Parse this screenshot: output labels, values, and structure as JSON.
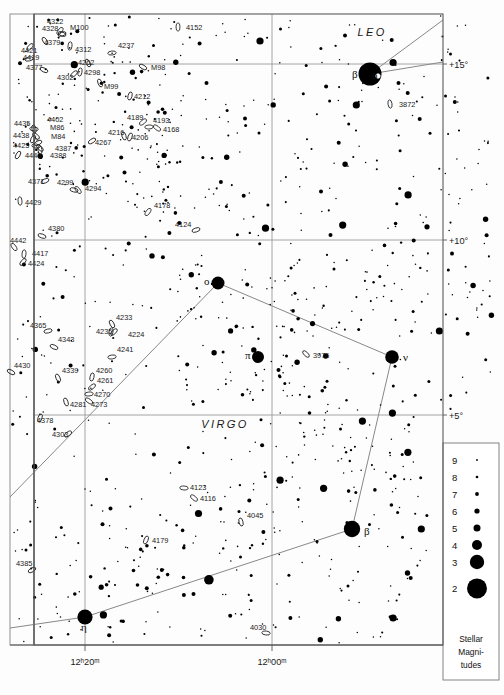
{
  "chart_data": {
    "type": "scatter",
    "xlabel": "Right Ascension",
    "ylabel": "Declination",
    "grid": true,
    "x_ticks": [
      {
        "label": "12ʰ20ᵐ",
        "x": 85
      },
      {
        "label": "12ʰ00ᵐ",
        "x": 272
      }
    ],
    "y_ticks": [
      {
        "label": "+15°",
        "y": 64
      },
      {
        "label": "+10°",
        "y": 240
      },
      {
        "label": "+5°",
        "y": 415
      }
    ],
    "constellations": [
      {
        "name": "LEO",
        "x": 372,
        "y": 36
      },
      {
        "name": "VIRGO",
        "x": 225,
        "y": 428
      }
    ],
    "named_stars": [
      {
        "name": "β",
        "x": 370,
        "y": 74,
        "r": 11.5,
        "label_dx": -18,
        "label_dy": 4
      },
      {
        "name": "o",
        "x": 378,
        "y": 76,
        "r": 2.2,
        "label_dx": -6,
        "label_dy": 3,
        "open": true
      },
      {
        "name": "ο",
        "x": 218,
        "y": 283,
        "r": 6.5,
        "label_dx": -14,
        "label_dy": 2
      },
      {
        "name": "π",
        "x": 258,
        "y": 357,
        "r": 6.0,
        "label_dx": -13,
        "label_dy": 2
      },
      {
        "name": "ν",
        "x": 392,
        "y": 357,
        "r": 6.8,
        "label_dx": 11,
        "label_dy": 4
      },
      {
        "name": "β",
        "x": 352,
        "y": 529,
        "r": 8.2,
        "label_dx": 12,
        "label_dy": 6
      },
      {
        "name": "η",
        "x": 85,
        "y": 617,
        "r": 7.6,
        "label_dx": -4,
        "label_dy": 14
      }
    ],
    "constellation_lines": [
      [
        [
          218,
          283
        ],
        [
          392,
          357
        ]
      ],
      [
        [
          218,
          283
        ],
        [
          10,
          497
        ]
      ],
      [
        [
          392,
          357
        ],
        [
          352,
          529
        ]
      ],
      [
        [
          352,
          529
        ],
        [
          85,
          617
        ]
      ],
      [
        [
          85,
          617
        ],
        [
          10,
          628
        ]
      ],
      [
        [
          370,
          74
        ],
        [
          443,
          20
        ]
      ],
      [
        [
          370,
          74
        ],
        [
          443,
          62
        ]
      ]
    ],
    "galaxies": [
      {
        "id": "4152",
        "lx": 186,
        "ly": 30,
        "ex": 178,
        "ey": 27
      },
      {
        "id": "4322",
        "lx": 47,
        "ly": 24,
        "ex": 60,
        "ey": 31
      },
      {
        "id": "4328",
        "lx": 42,
        "ly": 31,
        "ex": 62,
        "ey": 34
      },
      {
        "id": "M100",
        "lx": 70,
        "ly": 30,
        "ex": 62,
        "ey": 34
      },
      {
        "id": "4379",
        "lx": 44,
        "ly": 45,
        "ex": 45,
        "ey": 41
      },
      {
        "id": "4312",
        "lx": 75,
        "ly": 52,
        "ex": 70,
        "ey": 46
      },
      {
        "id": "4421",
        "lx": 21,
        "ly": 53,
        "ex": 30,
        "ey": 47
      },
      {
        "id": "4419",
        "lx": 23,
        "ly": 60,
        "ex": 29,
        "ey": 59
      },
      {
        "id": "4377",
        "lx": 26,
        "ly": 70,
        "ex": 44,
        "ey": 70
      },
      {
        "id": "4262",
        "lx": 78,
        "ly": 65,
        "ex": 88,
        "ey": 63
      },
      {
        "id": "4298",
        "lx": 84,
        "ly": 75,
        "ex": 80,
        "ey": 72
      },
      {
        "id": "4302",
        "lx": 57,
        "ly": 80,
        "ex": 74,
        "ey": 74
      },
      {
        "id": "4237",
        "lx": 118,
        "ly": 48,
        "ex": 112,
        "ey": 53
      },
      {
        "id": "M98",
        "lx": 151,
        "ly": 70,
        "ex": 143,
        "ey": 67
      },
      {
        "id": "M99",
        "lx": 104,
        "ly": 89,
        "ex": 100,
        "ey": 83
      },
      {
        "id": "4212",
        "lx": 134,
        "ly": 99,
        "ex": 130,
        "ey": 96
      },
      {
        "id": "4189",
        "lx": 127,
        "ly": 120,
        "ex": 143,
        "ey": 122
      },
      {
        "id": "4193",
        "lx": 153,
        "ly": 123,
        "ex": 149,
        "ey": 127
      },
      {
        "id": "4168",
        "lx": 163,
        "ly": 132,
        "ex": 157,
        "ey": 128
      },
      {
        "id": "4216",
        "lx": 108,
        "ly": 135,
        "ex": 124,
        "ey": 136
      },
      {
        "id": "4206",
        "lx": 132,
        "ly": 140,
        "ex": 130,
        "ey": 137
      },
      {
        "id": "4267",
        "lx": 95,
        "ly": 145,
        "ex": 92,
        "ey": 141
      },
      {
        "id": "4402",
        "lx": 47,
        "ly": 122,
        "ex": 34,
        "ey": 129
      },
      {
        "id": "M86",
        "lx": 50,
        "ly": 130,
        "ex": 36,
        "ey": 136
      },
      {
        "id": "4435",
        "lx": 14,
        "ly": 126,
        "ex": 34,
        "ey": 129
      },
      {
        "id": "4438",
        "lx": 13,
        "ly": 138,
        "ex": 33,
        "ey": 139
      },
      {
        "id": "M84",
        "lx": 51,
        "ly": 139,
        "ex": 38,
        "ey": 143
      },
      {
        "id": "4425",
        "lx": 13,
        "ly": 148,
        "ex": 36,
        "ey": 146
      },
      {
        "id": "4387",
        "lx": 55,
        "ly": 151,
        "ex": 40,
        "ey": 148
      },
      {
        "id": "4388",
        "lx": 50,
        "ly": 158,
        "ex": 40,
        "ey": 150
      },
      {
        "id": "4440",
        "lx": 25,
        "ly": 158,
        "ex": 18,
        "ey": 155
      },
      {
        "id": "4371",
        "lx": 28,
        "ly": 184,
        "ex": 45,
        "ey": 181
      },
      {
        "id": "4299",
        "lx": 57,
        "ly": 185,
        "ex": 74,
        "ey": 190
      },
      {
        "id": "4294",
        "lx": 85,
        "ly": 191,
        "ex": 78,
        "ey": 190
      },
      {
        "id": "4429",
        "lx": 25,
        "ly": 205,
        "ex": 20,
        "ey": 201
      },
      {
        "id": "4178",
        "lx": 154,
        "ly": 208,
        "ex": 148,
        "ey": 212
      },
      {
        "id": "4124",
        "lx": 175,
        "ly": 227,
        "ex": 196,
        "ey": 230
      },
      {
        "id": "4380",
        "lx": 48,
        "ly": 231,
        "ex": 42,
        "ey": 236
      },
      {
        "id": "4442",
        "lx": 10,
        "ly": 243,
        "ex": 14,
        "ey": 247
      },
      {
        "id": "4417",
        "lx": 32,
        "ly": 256,
        "ex": 24,
        "ey": 254
      },
      {
        "id": "4424",
        "lx": 28,
        "ly": 266,
        "ex": 23,
        "ey": 262
      },
      {
        "id": "4365",
        "lx": 30,
        "ly": 328,
        "ex": 48,
        "ey": 331
      },
      {
        "id": "4343",
        "lx": 58,
        "ly": 342,
        "ex": 54,
        "ey": 347
      },
      {
        "id": "4233",
        "lx": 116,
        "ly": 320,
        "ex": 112,
        "ey": 324
      },
      {
        "id": "4235",
        "lx": 96,
        "ly": 334,
        "ex": 111,
        "ey": 332
      },
      {
        "id": "4224",
        "lx": 128,
        "ly": 337,
        "ex": 114,
        "ey": 332
      },
      {
        "id": "4241",
        "lx": 117,
        "ly": 352,
        "ex": 112,
        "ey": 357
      },
      {
        "id": "4430",
        "lx": 14,
        "ly": 368,
        "ex": 11,
        "ey": 372
      },
      {
        "id": "4339",
        "lx": 62,
        "ly": 373,
        "ex": 58,
        "ey": 378
      },
      {
        "id": "4260",
        "lx": 96,
        "ly": 373,
        "ex": 92,
        "ey": 377
      },
      {
        "id": "4261",
        "lx": 97,
        "ly": 383,
        "ex": 92,
        "ey": 387
      },
      {
        "id": "4270",
        "lx": 94,
        "ly": 397,
        "ex": 89,
        "ey": 394
      },
      {
        "id": "4273",
        "lx": 91,
        "ly": 407,
        "ex": 89,
        "ey": 401
      },
      {
        "id": "4281",
        "lx": 70,
        "ly": 407,
        "ex": 66,
        "ey": 402
      },
      {
        "id": "4378",
        "lx": 37,
        "ly": 423,
        "ex": 40,
        "ey": 418
      },
      {
        "id": "4303",
        "lx": 52,
        "ly": 437,
        "ex": 68,
        "ey": 434
      },
      {
        "id": "4123",
        "lx": 190,
        "ly": 490,
        "ex": 184,
        "ey": 488
      },
      {
        "id": "4116",
        "lx": 200,
        "ly": 501,
        "ex": 194,
        "ey": 498
      },
      {
        "id": "4045",
        "lx": 247,
        "ly": 518,
        "ex": 241,
        "ey": 522
      },
      {
        "id": "4179",
        "lx": 152,
        "ly": 543,
        "ex": 146,
        "ey": 540
      },
      {
        "id": "4385",
        "lx": 16,
        "ly": 566,
        "ex": 32,
        "ey": 570
      },
      {
        "id": "4030",
        "lx": 250,
        "ly": 630,
        "ex": 266,
        "ey": 633
      },
      {
        "id": "3976",
        "lx": 313,
        "ly": 358,
        "ex": 306,
        "ey": 354
      },
      {
        "id": "3872",
        "lx": 399,
        "ly": 107,
        "ex": 390,
        "ey": 104
      }
    ],
    "legend": {
      "title_lines": [
        "Stellar",
        "Magni-",
        "tudes"
      ],
      "entries": [
        {
          "mag": "9",
          "r": 0.9
        },
        {
          "mag": "8",
          "r": 1.3
        },
        {
          "mag": "7",
          "r": 1.9
        },
        {
          "mag": "6",
          "r": 2.6
        },
        {
          "mag": "5",
          "r": 3.5
        },
        {
          "mag": "4",
          "r": 5.0
        },
        {
          "mag": "3",
          "r": 7.2
        },
        {
          "mag": "2",
          "r": 10.0
        }
      ]
    },
    "colors": {
      "background": "#fdfdfd",
      "star": "#000000",
      "grid": "#9a9a9a",
      "border": "#5a5a5a",
      "text": "#1a1a1a"
    }
  }
}
